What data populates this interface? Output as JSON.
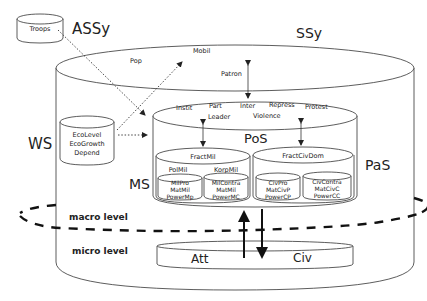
{
  "diagram": {
    "systems": {
      "assy": "ASSy",
      "ssy": "SSy",
      "ws": "WS",
      "pos": "PoS",
      "ms": "MS",
      "pas": "PaS"
    },
    "troops": "Troops",
    "ssy_labels": {
      "pop": "Pop",
      "mobil": "Mobil",
      "patron": "Patron"
    },
    "ws_box": [
      "EcoLevel",
      "EcoGrowth",
      "Depend"
    ],
    "pos_labels": {
      "insti": "Instit",
      "part": "Part",
      "inter": "Inter",
      "repress": "Repress",
      "protest": "Protest",
      "leader": "Leader",
      "violence": "Violence"
    },
    "fractmil": {
      "title": "FractMil",
      "polmil": "PolMil",
      "korpmil": "KorpMil",
      "left": [
        "MilPro",
        "MatMil",
        "PowerMp"
      ],
      "right": [
        "MilContra",
        "MatMil",
        "PowerMC"
      ]
    },
    "fractcivdom": {
      "title": "FractCivDom",
      "left": [
        "CivPro",
        "MatCivP",
        "PowerCP"
      ],
      "right": [
        "CivContra",
        "MatCivC",
        "PowerCC"
      ]
    },
    "levels": {
      "macro": "macro level",
      "micro": "micro level"
    },
    "micro_box": {
      "att": "Att",
      "civ": "Civ"
    }
  }
}
